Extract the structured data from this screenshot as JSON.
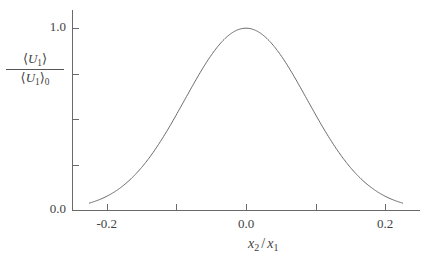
{
  "chart_data": {
    "type": "line",
    "title": "",
    "xlabel": "x_2 / x_1",
    "ylabel": "<U_1> / <U_1>_0",
    "xlim": [
      -0.25,
      0.25
    ],
    "ylim": [
      0.0,
      1.1
    ],
    "grid": false,
    "legend": null,
    "series": [
      {
        "name": "normalized mean velocity",
        "x": [
          -0.225,
          -0.21,
          -0.195,
          -0.18,
          -0.165,
          -0.15,
          -0.135,
          -0.12,
          -0.105,
          -0.09,
          -0.075,
          -0.06,
          -0.045,
          -0.03,
          -0.015,
          0.0,
          0.015,
          0.03,
          0.045,
          0.06,
          0.075,
          0.09,
          0.105,
          0.12,
          0.135,
          0.15,
          0.165,
          0.18,
          0.195,
          0.21,
          0.225
        ],
        "y": [
          0.044,
          0.066,
          0.095,
          0.134,
          0.183,
          0.243,
          0.313,
          0.392,
          0.476,
          0.562,
          0.646,
          0.724,
          0.792,
          0.847,
          0.885,
          1.0,
          0.885,
          0.847,
          0.792,
          0.724,
          0.646,
          0.562,
          0.476,
          0.392,
          0.313,
          0.243,
          0.183,
          0.134,
          0.095,
          0.066,
          0.044
        ]
      }
    ]
  },
  "axes": {
    "y": {
      "labels": [
        "1.0",
        "0.0"
      ],
      "label_values": [
        1.0,
        0.0
      ],
      "tick_values": [
        1.0,
        0.75,
        0.5,
        0.25,
        0.0
      ],
      "title": {
        "numerator_angle_open": "⟨",
        "numerator_var": "U",
        "numerator_sub": "1",
        "numerator_angle_close": "⟩",
        "denominator_angle_open": "⟨",
        "denominator_var": "U",
        "denominator_sub": "1",
        "denominator_angle_close": "⟩",
        "denominator_outer_sub": "0"
      }
    },
    "x": {
      "labels": [
        "-0.2",
        "0.0",
        "0.2"
      ],
      "label_values": [
        -0.2,
        0.0,
        0.2
      ],
      "tick_values": [
        -0.2,
        -0.1,
        0.0,
        0.1,
        0.2
      ],
      "title": {
        "var1": "x",
        "sub1": "2",
        "separator": "/",
        "var2": "x",
        "sub2": "1"
      }
    }
  },
  "style": {
    "background": "#ffffff",
    "axis_color": "#6a6a6a",
    "curve_color": "#6a6a6a",
    "text_color": "#3f3f3f"
  }
}
